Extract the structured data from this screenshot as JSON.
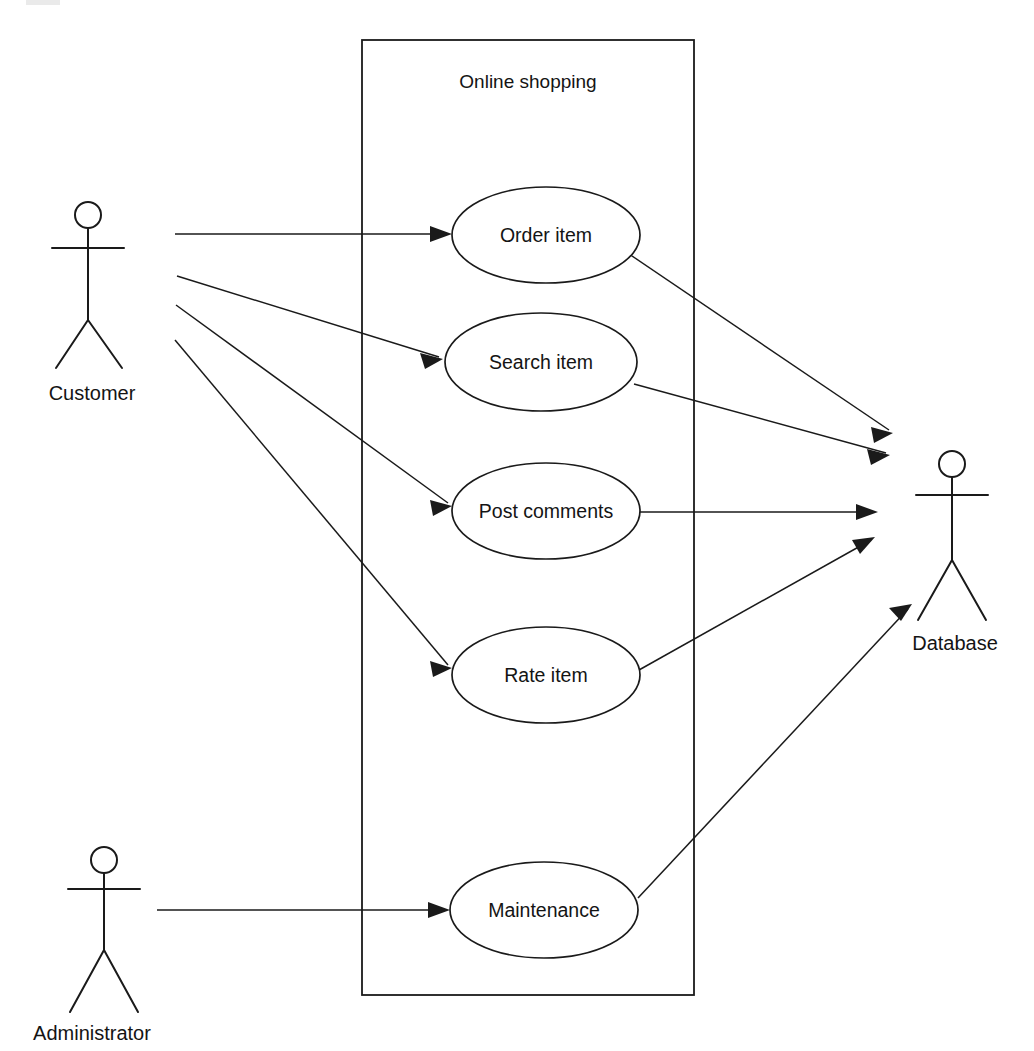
{
  "diagram": {
    "type": "uml-use-case-diagram",
    "title": "Online shopping",
    "background_color": "#ffffff",
    "line_color": "#1a1a1a",
    "boundary": {
      "label": "Online shopping",
      "x": 362,
      "y": 40,
      "width": 332,
      "height": 955,
      "label_x": 528,
      "label_y": 88
    },
    "actors": [
      {
        "id": "customer",
        "label": "Customer",
        "head_cx": 88,
        "head_cy": 215,
        "head_r": 13,
        "body_top": 228,
        "body_bottom": 320,
        "arm_y": 248,
        "arm_left": 52,
        "arm_right": 124,
        "leg_left_x": 56,
        "leg_right_x": 122,
        "leg_y": 368,
        "label_x": 92,
        "label_y": 400
      },
      {
        "id": "administrator",
        "label": "Administrator",
        "head_cx": 104,
        "head_cy": 860,
        "head_r": 13,
        "body_top": 873,
        "body_bottom": 950,
        "arm_y": 889,
        "arm_left": 68,
        "arm_right": 140,
        "leg_left_x": 70,
        "leg_right_x": 138,
        "leg_y": 1012,
        "label_x": 92,
        "label_y": 1040
      },
      {
        "id": "database",
        "label": "Database",
        "head_cx": 952,
        "head_cy": 464,
        "head_r": 13,
        "body_top": 477,
        "body_bottom": 560,
        "arm_y": 495,
        "arm_left": 916,
        "arm_right": 988,
        "leg_left_x": 918,
        "leg_right_x": 986,
        "leg_y": 620,
        "label_x": 955,
        "label_y": 650
      }
    ],
    "use_cases": [
      {
        "id": "order-item",
        "label": "Order item",
        "cx": 546,
        "cy": 235,
        "rx": 94,
        "ry": 48
      },
      {
        "id": "search-item",
        "label": "Search item",
        "cx": 541,
        "cy": 362,
        "rx": 96,
        "ry": 49
      },
      {
        "id": "post-comments",
        "label": "Post comments",
        "cx": 546,
        "cy": 511,
        "rx": 94,
        "ry": 48
      },
      {
        "id": "rate-item",
        "label": "Rate item",
        "cx": 546,
        "cy": 675,
        "rx": 94,
        "ry": 48
      },
      {
        "id": "maintenance",
        "label": "Maintenance",
        "cx": 544,
        "cy": 910,
        "rx": 94,
        "ry": 48
      }
    ],
    "associations": [
      {
        "id": "customer-to-order-item",
        "from": "customer",
        "to": "order-item",
        "x1": 175,
        "y1": 234,
        "x2": 452,
        "y2": 234
      },
      {
        "id": "customer-to-search-item",
        "from": "customer",
        "to": "search-item",
        "x1": 177,
        "y1": 276,
        "x2": 443,
        "y2": 359
      },
      {
        "id": "customer-to-post-comments",
        "from": "customer",
        "to": "post-comments",
        "x1": 176,
        "y1": 305,
        "x2": 452,
        "y2": 506
      },
      {
        "id": "customer-to-rate-item",
        "from": "customer",
        "to": "rate-item",
        "x1": 175,
        "y1": 340,
        "x2": 452,
        "y2": 668
      },
      {
        "id": "administrator-to-maintenance",
        "from": "administrator",
        "to": "maintenance",
        "x1": 157,
        "y1": 910,
        "x2": 450,
        "y2": 910
      },
      {
        "id": "order-item-to-database",
        "from": "order-item",
        "to": "database",
        "x1": 634,
        "y1": 257,
        "x2": 893,
        "y2": 433
      },
      {
        "id": "search-item-to-database",
        "from": "search-item",
        "to": "database",
        "x1": 634,
        "y1": 384,
        "x2": 890,
        "y2": 455
      },
      {
        "id": "post-comments-to-database",
        "from": "post-comments",
        "to": "database",
        "x1": 640,
        "y1": 512,
        "x2": 878,
        "y2": 512
      },
      {
        "id": "rate-item-to-database",
        "from": "rate-item",
        "to": "database",
        "x1": 639,
        "y1": 670,
        "x2": 875,
        "y2": 537
      },
      {
        "id": "maintenance-to-database",
        "from": "maintenance",
        "to": "database",
        "x1": 638,
        "y1": 898,
        "x2": 912,
        "y2": 604
      }
    ]
  }
}
